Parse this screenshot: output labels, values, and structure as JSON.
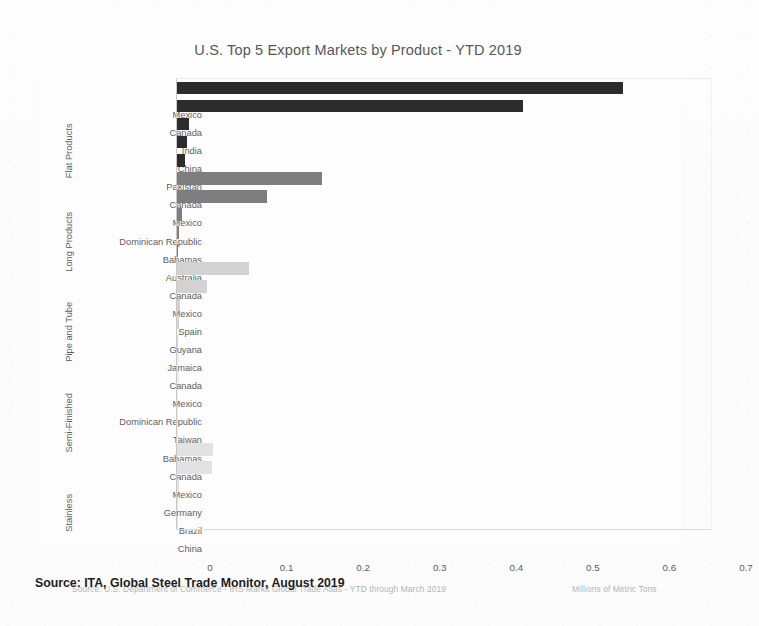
{
  "chart_data": {
    "type": "bar",
    "orientation": "horizontal",
    "title": "U.S. Top 5 Export Markets by Product - YTD 2019",
    "xlabel": "Millions of Metric Tons",
    "ylabel": "",
    "xlim": [
      0,
      0.7
    ],
    "xticks": [
      "0",
      "0.1",
      "0.2",
      "0.3",
      "0.4",
      "0.5",
      "0.6",
      "0.7"
    ],
    "xtick_values": [
      0,
      0.1,
      0.2,
      0.3,
      0.4,
      0.5,
      0.6,
      0.7
    ],
    "grid": false,
    "legend": "none",
    "source_note": "Source: U.S. Department of Commerce - IHS Markit Global Trade Atlas - YTD through March 2019",
    "groups": [
      {
        "name": "Flat Products",
        "color": "#2c2c2c",
        "categories": [
          "Mexico",
          "Canada",
          "India",
          "China",
          "Pakistan"
        ],
        "values": [
          0.583,
          0.452,
          0.016,
          0.013,
          0.011
        ]
      },
      {
        "name": "Long Products",
        "color": "#7e7e7e",
        "categories": [
          "Canada",
          "Mexico",
          "Dominican Republic",
          "Bahamas",
          "Australia"
        ],
        "values": [
          0.189,
          0.117,
          0.007,
          0.002,
          0.001
        ]
      },
      {
        "name": "Pipe and Tube",
        "color": "#d2d2d2",
        "categories": [
          "Canada",
          "Mexico",
          "Spain",
          "Guyana",
          "Jamaica"
        ],
        "values": [
          0.094,
          0.039,
          0.004,
          0.002,
          0.001
        ]
      },
      {
        "name": "Semi-Finished",
        "color": "#ececec",
        "categories": [
          "Canada",
          "Mexico",
          "Dominican Republic",
          "Taiwan",
          "Bahamas"
        ],
        "values": [
          0.003,
          0.002,
          0.001,
          0.001,
          0.001
        ]
      },
      {
        "name": "Stainless",
        "color": "#e2e2e2",
        "categories": [
          "Canada",
          "Mexico",
          "Germany",
          "Brazil",
          "China"
        ],
        "values": [
          0.047,
          0.046,
          0.002,
          0.001,
          0.001
        ]
      }
    ]
  },
  "caption": "Source: ITA, Global Steel Trade Monitor, August 2019"
}
